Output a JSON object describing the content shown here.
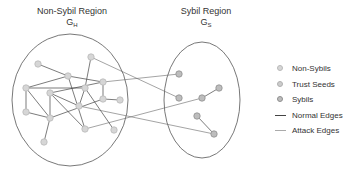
{
  "regions": {
    "honest": {
      "title": "Non-Sybil Region",
      "symbol": "G",
      "subscript": "H",
      "ellipse": {
        "cx": 70,
        "cy": 100,
        "rx": 58,
        "ry": 66
      }
    },
    "sybil": {
      "title": "Sybil Region",
      "symbol": "G",
      "subscript": "S",
      "ellipse": {
        "cx": 202,
        "cy": 100,
        "rx": 38,
        "ry": 58
      }
    }
  },
  "colors": {
    "ellipse_stroke": "#555555",
    "normal_edge": "#444444",
    "attack_edge": "#666666",
    "non_sybil_fill": "#d6d6d6",
    "non_sybil_stroke": "#b9b9b9",
    "trust_seed_fill": "#cccccc",
    "trust_seed_stroke": "#b0b0b0",
    "sybil_fill": "#bdbdbd",
    "sybil_stroke": "#8f8f8f"
  },
  "nodes": [
    {
      "id": "h1",
      "x": 38,
      "y": 64,
      "type": "non-sybil"
    },
    {
      "id": "h2",
      "x": 91,
      "y": 57,
      "type": "non-sybil"
    },
    {
      "id": "h3",
      "x": 68,
      "y": 76,
      "type": "non-sybil"
    },
    {
      "id": "h4",
      "x": 103,
      "y": 82,
      "type": "non-sybil"
    },
    {
      "id": "h5",
      "x": 26,
      "y": 88,
      "type": "non-sybil"
    },
    {
      "id": "h6",
      "x": 85,
      "y": 88,
      "type": "non-sybil"
    },
    {
      "id": "h7",
      "x": 50,
      "y": 93,
      "type": "non-sybil"
    },
    {
      "id": "h8",
      "x": 103,
      "y": 99,
      "type": "non-sybil"
    },
    {
      "id": "h9",
      "x": 120,
      "y": 100,
      "type": "non-sybil"
    },
    {
      "id": "h10",
      "x": 79,
      "y": 106,
      "type": "non-sybil"
    },
    {
      "id": "h11",
      "x": 26,
      "y": 112,
      "type": "non-sybil"
    },
    {
      "id": "h12",
      "x": 50,
      "y": 118,
      "type": "non-sybil"
    },
    {
      "id": "h13",
      "x": 85,
      "y": 129,
      "type": "non-sybil"
    },
    {
      "id": "h14",
      "x": 114,
      "y": 130,
      "type": "non-sybil"
    },
    {
      "id": "h15",
      "x": 44,
      "y": 142,
      "type": "non-sybil"
    },
    {
      "id": "s1",
      "x": 179,
      "y": 74,
      "type": "sybil"
    },
    {
      "id": "s2",
      "x": 179,
      "y": 98,
      "type": "sybil"
    },
    {
      "id": "s3",
      "x": 202,
      "y": 98,
      "type": "sybil"
    },
    {
      "id": "s4",
      "x": 219,
      "y": 88,
      "type": "sybil"
    },
    {
      "id": "s5",
      "x": 197,
      "y": 116,
      "type": "sybil"
    },
    {
      "id": "s6",
      "x": 214,
      "y": 134,
      "type": "sybil"
    }
  ],
  "edges": [
    {
      "from": "h1",
      "to": "h3",
      "type": "normal"
    },
    {
      "from": "h3",
      "to": "h4",
      "type": "normal"
    },
    {
      "from": "h3",
      "to": "h5",
      "type": "normal"
    },
    {
      "from": "h3",
      "to": "h13",
      "type": "normal"
    },
    {
      "from": "h2",
      "to": "h6",
      "type": "normal"
    },
    {
      "from": "h5",
      "to": "h11",
      "type": "normal"
    },
    {
      "from": "h5",
      "to": "h12",
      "type": "normal"
    },
    {
      "from": "h5",
      "to": "h6",
      "type": "normal"
    },
    {
      "from": "h7",
      "to": "h4",
      "type": "normal"
    },
    {
      "from": "h7",
      "to": "h12",
      "type": "normal"
    },
    {
      "from": "h7",
      "to": "h10",
      "type": "normal"
    },
    {
      "from": "h7",
      "to": "h13",
      "type": "normal"
    },
    {
      "from": "h6",
      "to": "h10",
      "type": "normal"
    },
    {
      "from": "h6",
      "to": "h14",
      "type": "normal"
    },
    {
      "from": "h4",
      "to": "h8",
      "type": "normal"
    },
    {
      "from": "h8",
      "to": "h9",
      "type": "normal"
    },
    {
      "from": "h8",
      "to": "h12",
      "type": "normal"
    },
    {
      "from": "h11",
      "to": "h12",
      "type": "normal"
    },
    {
      "from": "h12",
      "to": "h15",
      "type": "normal"
    },
    {
      "from": "s3",
      "to": "s4",
      "type": "normal"
    },
    {
      "from": "s5",
      "to": "s6",
      "type": "normal"
    },
    {
      "from": "h2",
      "to": "s2",
      "type": "attack"
    },
    {
      "from": "h4",
      "to": "s1",
      "type": "attack"
    },
    {
      "from": "h13",
      "to": "s3",
      "type": "attack"
    },
    {
      "from": "h10",
      "to": "s6",
      "type": "attack"
    }
  ],
  "legend": {
    "items": [
      {
        "label": "Non-Sybils",
        "icon": "non-sybil-node-icon",
        "kind": "dot",
        "fill": "#d6d6d6",
        "stroke": "#b9b9b9"
      },
      {
        "label": "Trust Seeds",
        "icon": "trust-seed-node-icon",
        "kind": "dot",
        "fill": "#cccccc",
        "stroke": "#b0b0b0"
      },
      {
        "label": "Sybils",
        "icon": "sybil-node-icon",
        "kind": "dot",
        "fill": "#bdbdbd",
        "stroke": "#8f8f8f"
      },
      {
        "label": "Normal Edges",
        "icon": "normal-edge-icon",
        "kind": "line",
        "color": "#444444"
      },
      {
        "label": "Attack Edges",
        "icon": "attack-edge-icon",
        "kind": "line",
        "color": "#aaaaaa"
      }
    ]
  }
}
